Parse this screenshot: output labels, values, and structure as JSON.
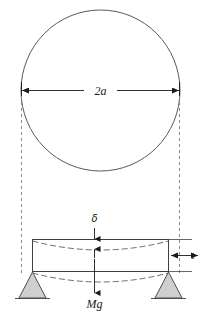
{
  "figure": {
    "background_color": "#ffffff",
    "stroke_color": "#595959",
    "dark_stroke_color": "#1a1a1a",
    "dashed_color": "#6e6e6e",
    "support_fill": "#cfcfcf",
    "labels": {
      "diameter": "2a",
      "deflection": "δ",
      "thickness": "t",
      "weight": "Mg"
    },
    "elements": {
      "sphere_name": "sphere-outline",
      "diameter_dimension_name": "diameter-dimension-2a",
      "beam_name": "beam-body",
      "deflected_top_name": "deflected-top-curve",
      "deflected_bottom_name": "deflected-bottom-curve",
      "left_support_name": "left-triangle-support",
      "right_support_name": "right-triangle-support",
      "load_arrow_name": "weight-load-arrow-Mg",
      "deflection_dimension_name": "deflection-dimension-delta",
      "thickness_dimension_name": "thickness-dimension-t",
      "left_projection_name": "left-projection-dashed-line",
      "right_projection_name": "right-projection-dashed-line"
    }
  }
}
